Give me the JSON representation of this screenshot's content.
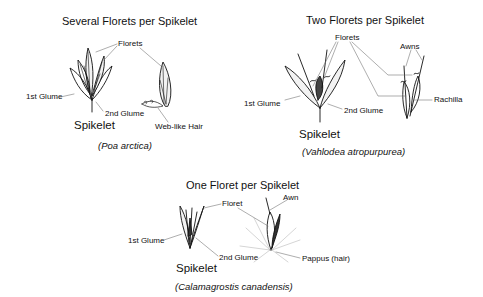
{
  "panels": [
    {
      "title": "Several Florets per Spikelet",
      "labels": {
        "florets": "Florets",
        "glume1": "1st Glume",
        "glume2": "2nd Glume",
        "hair": "Web-like Hair"
      },
      "spikelet_label": "Spikelet",
      "species": "(Poa arctica)"
    },
    {
      "title": "Two Florets per Spikelet",
      "labels": {
        "florets": "Florets",
        "awns": "Awns",
        "glume1": "1st Glume",
        "glume2": "2nd Glume",
        "rachilla": "Rachilla"
      },
      "spikelet_label": "Spikelet",
      "species": "(Vahlodea atropurpurea)"
    },
    {
      "title": "One Floret per Spikelet",
      "labels": {
        "floret": "Floret",
        "awn": "Awn",
        "glume1": "1st Glume",
        "glume2": "2nd Glume",
        "pappus": "Pappus (hair)"
      },
      "spikelet_label": "Spikelet",
      "species": "(Calamagrostis canadensis)"
    }
  ]
}
